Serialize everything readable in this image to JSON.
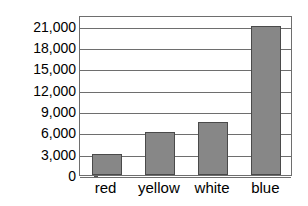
{
  "chart_data": {
    "type": "bar",
    "title": "",
    "xlabel": "",
    "ylabel": "Temperature,°C",
    "categories": [
      "red",
      "yellow",
      "white",
      "blue"
    ],
    "values": [
      3000,
      6000,
      7500,
      21000
    ],
    "ylim": [
      0,
      22500
    ],
    "ytick_values": [
      0,
      3000,
      6000,
      9000,
      12000,
      15000,
      18000,
      21000
    ],
    "ytick_labels": [
      "0",
      "3,000",
      "6,000",
      "9,000",
      "12,000",
      "15,000",
      "18,000",
      "21,000"
    ],
    "grid": "horizontal",
    "legend": "none",
    "bar_color": "#878787",
    "bar_edge_color": "#4a4a4a",
    "frame_color": "#6e6e6e",
    "background_color": "#ffffff"
  }
}
